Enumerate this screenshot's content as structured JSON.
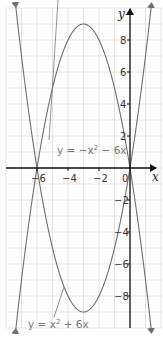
{
  "chart_data": {
    "type": "line",
    "title": "",
    "xlabel": "x",
    "ylabel": "y",
    "xlim": [
      -8,
      2
    ],
    "ylim": [
      -10,
      10
    ],
    "grid": true,
    "x_ticks": [
      -6,
      -4,
      -2,
      0
    ],
    "x_tick_labels": [
      "-6",
      "-4",
      "-2",
      "0"
    ],
    "y_ticks": [
      8,
      6,
      4,
      2,
      -2,
      -4,
      -6,
      -8
    ],
    "y_tick_labels": [
      "8",
      "6",
      "4",
      "2",
      "-2",
      "-4",
      "-6",
      "-8"
    ],
    "series": [
      {
        "name": "y = -x² - 6x",
        "label_text": "y = −x² − 6x",
        "function": "-x^2-6x",
        "vertex": [
          -3,
          9
        ],
        "roots": [
          -6,
          0
        ],
        "color": "#6e6e6e"
      },
      {
        "name": "y = x² + 6x",
        "label_text": "y = x² + 6x",
        "function": "x^2+6x",
        "vertex": [
          -3,
          -9
        ],
        "roots": [
          -6,
          0
        ],
        "color": "#6e6e6e"
      }
    ]
  },
  "labels": {
    "x_axis": "x",
    "y_axis": "y",
    "eq_top_prefix": "y = −x",
    "eq_top_sup": "2",
    "eq_top_suffix": " − 6x",
    "eq_bottom_prefix": "y = x",
    "eq_bottom_sup": "2",
    "eq_bottom_suffix": " + 6x"
  },
  "colors": {
    "grid": "#dcdcdc",
    "axis": "#111111",
    "curve": "#6e6e6e",
    "text": "#333333"
  }
}
